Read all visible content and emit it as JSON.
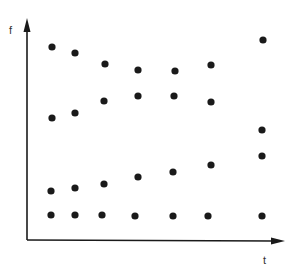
{
  "chart_data": {
    "type": "scatter",
    "title": "",
    "xlabel": "t",
    "ylabel": "f",
    "grid": false,
    "legend": null,
    "ticks": false,
    "series": [
      {
        "name": "row-1",
        "points": [
          [
            52,
            47
          ],
          [
            75,
            53
          ],
          [
            105,
            64
          ],
          [
            138,
            70
          ],
          [
            175,
            71
          ],
          [
            211,
            65
          ],
          [
            263,
            40
          ]
        ]
      },
      {
        "name": "row-2",
        "points": [
          [
            52,
            118
          ],
          [
            75,
            113
          ],
          [
            104,
            101
          ],
          [
            138,
            96
          ],
          [
            174,
            96
          ],
          [
            211,
            102
          ],
          [
            262,
            130
          ]
        ]
      },
      {
        "name": "row-3",
        "points": [
          [
            51,
            191
          ],
          [
            75,
            188
          ],
          [
            104,
            184
          ],
          [
            138,
            177
          ],
          [
            173,
            172
          ],
          [
            211,
            165
          ],
          [
            262,
            156
          ]
        ]
      },
      {
        "name": "row-4",
        "points": [
          [
            51,
            215
          ],
          [
            75,
            215
          ],
          [
            102,
            215
          ],
          [
            135,
            216
          ],
          [
            173,
            216
          ],
          [
            208,
            216
          ],
          [
            262,
            216
          ]
        ]
      }
    ],
    "point_color": "#1a1a1a",
    "axis_color": "#1a1a1a"
  },
  "labels": {
    "x_axis": "t",
    "y_axis": "f"
  }
}
